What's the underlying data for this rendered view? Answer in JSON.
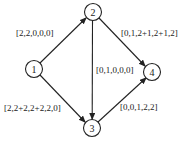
{
  "diagram": {
    "type": "directed-graph",
    "nodes": [
      {
        "id": "1",
        "label": "1",
        "x": 34,
        "y": 69
      },
      {
        "id": "2",
        "label": "2",
        "x": 93,
        "y": 12
      },
      {
        "id": "3",
        "label": "3",
        "x": 92,
        "y": 128
      },
      {
        "id": "4",
        "label": "4",
        "x": 152,
        "y": 72
      }
    ],
    "edges": [
      {
        "from": "1",
        "to": "2",
        "label": "[2,2,0,0,0]"
      },
      {
        "from": "2",
        "to": "4",
        "label": "[0,1,2+1,2+1,2]"
      },
      {
        "from": "2",
        "to": "3",
        "label": "[0,1,0,0,0]"
      },
      {
        "from": "1",
        "to": "3",
        "label": "[2,2+2,2+2,2,0]"
      },
      {
        "from": "3",
        "to": "4",
        "label": "[0,0,1,2,2]"
      }
    ],
    "colors": {
      "stroke": "#222222",
      "background": "#ffffff"
    }
  }
}
